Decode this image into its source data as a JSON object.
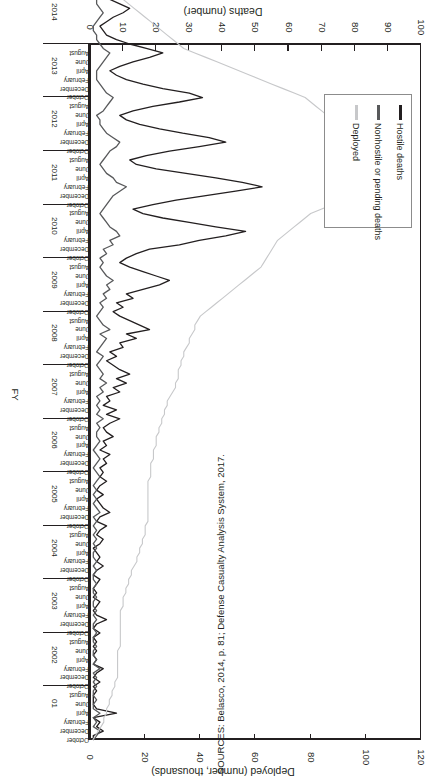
{
  "figure": {
    "orientation": "rotated-180",
    "source_note": "SOURCES: Belasco, 2014, p. 81; Defense Casualty Analysis System, 2017."
  },
  "axes": {
    "deployed": {
      "title": "Deployed (number, thousands)",
      "ticks": [
        "0",
        "20",
        "40",
        "60",
        "80",
        "100",
        "120"
      ],
      "min": 0,
      "max": 120
    },
    "deaths": {
      "title": "Deaths (number)",
      "ticks": [
        "0",
        "10",
        "20",
        "30",
        "40",
        "50",
        "60",
        "70",
        "80",
        "90",
        "100"
      ],
      "min": 0,
      "max": 100
    },
    "category": {
      "title": "FY",
      "years": [
        "01",
        "2002",
        "2003",
        "2004",
        "2005",
        "2006",
        "2007",
        "2008",
        "2009",
        "2010",
        "2011",
        "2012",
        "2013",
        "2014"
      ],
      "months": [
        "October",
        "December",
        "February",
        "April",
        "June",
        "August"
      ]
    }
  },
  "legend": {
    "items": [
      {
        "label": "Hostile deaths",
        "color": "#231f20"
      },
      {
        "label": "Nonhostile or pending deaths",
        "color": "#58595b"
      },
      {
        "label": "Deployed",
        "color": "#c7c8ca"
      }
    ]
  },
  "chart_data": {
    "type": "line",
    "title": "",
    "subtitle": "",
    "xlabel": "FY",
    "ylabel": "Deaths (number)",
    "y2label": "Deployed (number, thousands)",
    "ylim": [
      0,
      100
    ],
    "y2lim": [
      0,
      120
    ],
    "grid": false,
    "legend_position": "inside-left",
    "orientation": "rotated-180",
    "x_tick_labels": [
      "01",
      "2002",
      "2003",
      "2004",
      "2005",
      "2006",
      "2007",
      "2008",
      "2009",
      "2010",
      "2011",
      "2012",
      "2013",
      "2014"
    ],
    "x_month_labels": [
      "October",
      "December",
      "February",
      "April",
      "June",
      "August"
    ],
    "x_start": "October 2001",
    "x_end": "October 2014",
    "x_step": "monthly",
    "n_points": 157,
    "series": [
      {
        "name": "Hostile deaths",
        "color": "#231f20",
        "axis": "left",
        "units": "number",
        "values": [
          1,
          1,
          4,
          2,
          3,
          1,
          8,
          2,
          1,
          1,
          1,
          2,
          1,
          3,
          1,
          2,
          4,
          1,
          2,
          1,
          2,
          1,
          2,
          1,
          3,
          1,
          2,
          5,
          2,
          1,
          2,
          3,
          1,
          2,
          1,
          2,
          3,
          1,
          2,
          4,
          2,
          3,
          2,
          1,
          3,
          4,
          2,
          3,
          5,
          2,
          3,
          6,
          4,
          3,
          2,
          4,
          2,
          3,
          5,
          3,
          4,
          3,
          5,
          4,
          6,
          3,
          5,
          4,
          7,
          5,
          4,
          6,
          9,
          5,
          8,
          4,
          6,
          5,
          9,
          7,
          11,
          8,
          12,
          9,
          7,
          5,
          8,
          6,
          10,
          9,
          14,
          11,
          18,
          15,
          12,
          9,
          7,
          10,
          8,
          13,
          11,
          16,
          21,
          24,
          20,
          16,
          12,
          9,
          11,
          14,
          18,
          27,
          33,
          41,
          47,
          38,
          30,
          22,
          16,
          13,
          19,
          26,
          35,
          44,
          52,
          46,
          38,
          29,
          20,
          14,
          12,
          17,
          24,
          33,
          41,
          36,
          28,
          21,
          15,
          11,
          9,
          13,
          19,
          27,
          34,
          30,
          22,
          16,
          11,
          8,
          6,
          9,
          13,
          18,
          22,
          17,
          12,
          8,
          5,
          4,
          3,
          5,
          7,
          10,
          12,
          9,
          6,
          4,
          3,
          2,
          2,
          3,
          5,
          7,
          8,
          6,
          4,
          3,
          2,
          2
        ]
      },
      {
        "name": "Nonhostile or pending deaths",
        "color": "#58595b",
        "axis": "left",
        "units": "number",
        "values": [
          1,
          2,
          3,
          1,
          2,
          1,
          3,
          1,
          1,
          2,
          1,
          1,
          2,
          1,
          2,
          1,
          3,
          1,
          2,
          1,
          1,
          2,
          1,
          1,
          2,
          1,
          1,
          2,
          1,
          2,
          1,
          1,
          2,
          1,
          1,
          2,
          1,
          1,
          2,
          1,
          2,
          1,
          1,
          2,
          1,
          2,
          1,
          2,
          1,
          2,
          1,
          3,
          2,
          1,
          2,
          1,
          2,
          1,
          2,
          3,
          2,
          1,
          2,
          3,
          2,
          1,
          2,
          3,
          2,
          2,
          3,
          2,
          4,
          2,
          3,
          2,
          3,
          2,
          4,
          3,
          5,
          3,
          4,
          3,
          2,
          3,
          4,
          2,
          3,
          4,
          5,
          3,
          6,
          4,
          3,
          2,
          3,
          4,
          3,
          5,
          4,
          6,
          5,
          7,
          5,
          4,
          3,
          4,
          3,
          5,
          4,
          7,
          6,
          9,
          8,
          6,
          5,
          4,
          3,
          4,
          5,
          6,
          7,
          9,
          11,
          8,
          7,
          5,
          4,
          3,
          4,
          5,
          6,
          8,
          9,
          7,
          5,
          4,
          3,
          3,
          2,
          4,
          5,
          6,
          7,
          5,
          4,
          3,
          2,
          2,
          2,
          3,
          4,
          5,
          6,
          4,
          3,
          2,
          2,
          1,
          1,
          2,
          3,
          4,
          3,
          2,
          2,
          1,
          1,
          1
        ]
      },
      {
        "name": "Deployed",
        "color": "#c7c8ca",
        "axis": "right",
        "units": "thousands",
        "values": [
          1,
          2,
          3,
          4,
          5,
          5,
          6,
          6,
          7,
          7,
          8,
          8,
          9,
          9,
          10,
          10,
          10,
          10,
          10,
          10,
          10,
          11,
          11,
          11,
          11,
          11,
          11,
          11,
          11,
          11,
          12,
          12,
          12,
          13,
          13,
          14,
          14,
          15,
          15,
          16,
          17,
          17,
          18,
          18,
          19,
          19,
          20,
          20,
          20,
          21,
          21,
          21,
          21,
          21,
          21,
          21,
          21,
          21,
          21,
          22,
          22,
          22,
          22,
          23,
          23,
          23,
          24,
          24,
          24,
          25,
          25,
          26,
          26,
          27,
          27,
          28,
          28,
          29,
          30,
          31,
          31,
          32,
          32,
          32,
          33,
          33,
          34,
          34,
          35,
          36,
          36,
          37,
          38,
          38,
          39,
          40,
          42,
          44,
          46,
          48,
          50,
          52,
          54,
          56,
          58,
          60,
          62,
          63,
          64,
          65,
          66,
          67,
          68,
          70,
          72,
          74,
          76,
          78,
          80,
          84,
          88,
          92,
          94,
          96,
          97,
          98,
          99,
          99,
          100,
          100,
          100,
          100,
          99,
          98,
          97,
          96,
          94,
          92,
          90,
          88,
          86,
          84,
          82,
          80,
          78,
          74,
          70,
          66,
          62,
          58,
          54,
          50,
          46,
          42,
          38,
          34,
          32,
          30,
          28,
          26,
          24,
          22,
          20,
          18,
          16,
          14,
          12,
          11,
          10
        ]
      }
    ]
  }
}
